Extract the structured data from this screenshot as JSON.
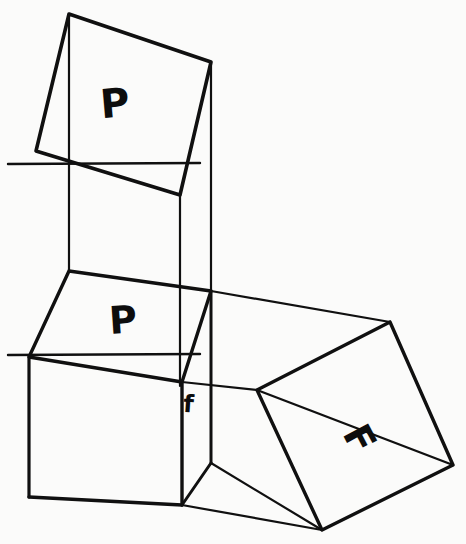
{
  "figure": {
    "background_color": "#fbfbfa",
    "ink_color": "#101010",
    "width": 466,
    "height": 544,
    "labels": [
      {
        "name": "label-P-upper",
        "text": "P",
        "x": 116,
        "y": 117,
        "font_size": 40,
        "rotation": -5
      },
      {
        "name": "label-P-lower",
        "text": "P",
        "x": 124,
        "y": 333,
        "font_size": 38,
        "rotation": -4
      },
      {
        "name": "label-F-large",
        "text": "F",
        "x": 348,
        "y": 445,
        "font_size": 38,
        "rotation": 62
      },
      {
        "name": "label-f-small",
        "text": "f",
        "x": 188,
        "y": 412,
        "font_size": 24,
        "rotation": 4
      }
    ],
    "strokes": [
      {
        "name": "upper-square-P-outline",
        "width": 3.6,
        "points": "69,14 211,62 180,195 36,151 69,14"
      },
      {
        "name": "upper-prism-left-edge",
        "width": 2.2,
        "points": "69,14 69,271"
      },
      {
        "name": "upper-prism-back-vertical",
        "width": 2.2,
        "points": "211,62 211,291"
      },
      {
        "name": "upper-prism-mid-vertical",
        "width": 2.2,
        "points": "180,195 180,386"
      },
      {
        "name": "reference-line-upper",
        "width": 2.4,
        "points": "8,164 200,163"
      },
      {
        "name": "cube-top-face",
        "width": 3.4,
        "points": "69,271 211,291 182,382 29,357 69,271"
      },
      {
        "name": "cube-left-vertical",
        "width": 3.2,
        "points": "29,357 29,497"
      },
      {
        "name": "cube-front-vertical",
        "width": 3.4,
        "points": "182,382 182,505"
      },
      {
        "name": "cube-bottom-front",
        "width": 3.4,
        "points": "29,497 182,505"
      },
      {
        "name": "cube-right-vertical",
        "width": 3.0,
        "points": "211,291 211,463"
      },
      {
        "name": "cube-bottom-right-edge",
        "width": 3.0,
        "points": "182,505 211,463"
      },
      {
        "name": "reference-line-lower",
        "width": 2.4,
        "points": "8,355 200,354"
      },
      {
        "name": "prism-F-top-long-edge",
        "width": 2.2,
        "points": "211,291 390,322"
      },
      {
        "name": "prism-F-mid-long-edge",
        "width": 2.2,
        "points": "182,382 257,390"
      },
      {
        "name": "prism-F-lower-long-edge",
        "width": 2.2,
        "points": "211,463 322,530"
      },
      {
        "name": "prism-F-bottom-long-edge",
        "width": 2.2,
        "points": "182,505 322,530"
      },
      {
        "name": "square-F-outline",
        "width": 3.4,
        "points": "390,322 453,465 322,530 257,390 390,322"
      },
      {
        "name": "square-F-diagonal",
        "width": 2.4,
        "points": "257,390 453,465"
      }
    ]
  }
}
